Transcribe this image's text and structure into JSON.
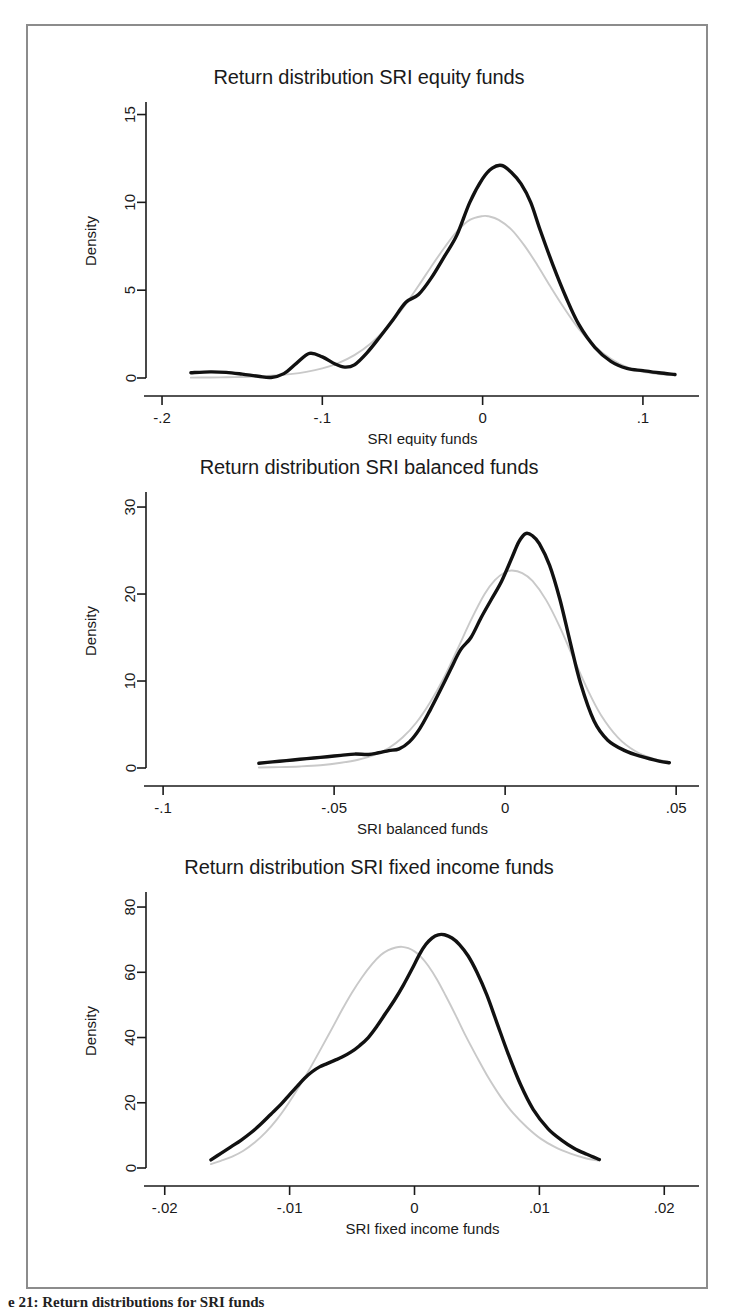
{
  "figure": {
    "caption": "e 21: Return distributions for SRI funds"
  },
  "panels": [
    {
      "id": "equity",
      "title": "Return distribution SRI equity funds",
      "xlabel": "SRI equity funds",
      "ylabel": "Density",
      "xticks": [
        "-.2",
        "-.1",
        "0",
        ".1"
      ],
      "yticks": [
        "0",
        "5",
        "10",
        "15"
      ]
    },
    {
      "id": "balanced",
      "title": "Return distribution SRI balanced funds",
      "xlabel": "SRI balanced funds",
      "ylabel": "Density",
      "xticks": [
        "-.1",
        "-.05",
        "0",
        ".05"
      ],
      "yticks": [
        "0",
        "10",
        "20",
        "30"
      ]
    },
    {
      "id": "fixed_income",
      "title": "Return distribution SRI fixed income funds",
      "xlabel": "SRI fixed income funds",
      "ylabel": "Density",
      "xticks": [
        "-.02",
        "-.01",
        "0",
        ".01",
        ".02"
      ],
      "yticks": [
        "0",
        "20",
        "40",
        "60",
        "80"
      ]
    }
  ],
  "chart_data": [
    {
      "type": "line",
      "title": "Return distribution SRI equity funds",
      "xlabel": "SRI equity funds",
      "ylabel": "Density",
      "xlim": [
        -0.21,
        0.125
      ],
      "ylim": [
        0,
        15.6
      ],
      "xticks": [
        -0.2,
        -0.1,
        0,
        0.1
      ],
      "yticks": [
        0,
        5,
        10,
        15
      ],
      "grid": false,
      "legend": "none",
      "series": [
        {
          "name": "Kernel density (SRI equity funds)",
          "color": "#111111",
          "x": [
            -0.182,
            -0.17,
            -0.16,
            -0.15,
            -0.14,
            -0.132,
            -0.124,
            -0.116,
            -0.108,
            -0.1,
            -0.092,
            -0.086,
            -0.08,
            -0.072,
            -0.064,
            -0.056,
            -0.048,
            -0.04,
            -0.032,
            -0.024,
            -0.016,
            -0.008,
            0.0,
            0.006,
            0.012,
            0.018,
            0.024,
            0.03,
            0.036,
            0.044,
            0.052,
            0.06,
            0.07,
            0.08,
            0.09,
            0.1,
            0.11,
            0.12
          ],
          "y": [
            0.3,
            0.35,
            0.32,
            0.22,
            0.1,
            0.03,
            0.25,
            0.85,
            1.4,
            1.2,
            0.8,
            0.62,
            0.75,
            1.45,
            2.35,
            3.3,
            4.3,
            4.75,
            5.7,
            6.9,
            8.15,
            10.0,
            11.35,
            11.95,
            12.1,
            11.7,
            11.05,
            10.0,
            8.4,
            6.4,
            4.6,
            3.05,
            1.75,
            0.95,
            0.55,
            0.42,
            0.3,
            0.2
          ]
        },
        {
          "name": "Normal reference density",
          "color": "#c9c9c9",
          "x": [
            -0.182,
            -0.17,
            -0.16,
            -0.15,
            -0.14,
            -0.13,
            -0.12,
            -0.11,
            -0.1,
            -0.09,
            -0.08,
            -0.07,
            -0.06,
            -0.05,
            -0.04,
            -0.032,
            -0.024,
            -0.016,
            -0.008,
            0.0,
            0.004,
            0.01,
            0.018,
            0.026,
            0.034,
            0.042,
            0.05,
            0.06,
            0.07,
            0.08,
            0.09,
            0.1,
            0.11,
            0.12
          ],
          "y": [
            0.02,
            0.03,
            0.04,
            0.06,
            0.09,
            0.14,
            0.22,
            0.35,
            0.55,
            0.85,
            1.3,
            1.95,
            2.85,
            3.95,
            5.25,
            6.35,
            7.4,
            8.35,
            9.0,
            9.22,
            9.2,
            9.0,
            8.45,
            7.55,
            6.45,
            5.25,
            4.1,
            2.8,
            1.8,
            1.1,
            0.62,
            0.35,
            0.22,
            0.15
          ]
        }
      ]
    },
    {
      "type": "line",
      "title": "Return distribution SRI balanced funds",
      "xlabel": "SRI balanced funds",
      "ylabel": "Density",
      "xlim": [
        -0.105,
        0.052
      ],
      "ylim": [
        0,
        31.5
      ],
      "xticks": [
        -0.1,
        -0.05,
        0,
        0.05
      ],
      "yticks": [
        0,
        10,
        20,
        30
      ],
      "grid": false,
      "legend": "none",
      "series": [
        {
          "name": "Kernel density (SRI balanced funds)",
          "color": "#111111",
          "x": [
            -0.072,
            -0.068,
            -0.064,
            -0.06,
            -0.056,
            -0.052,
            -0.048,
            -0.044,
            -0.04,
            -0.037,
            -0.034,
            -0.031,
            -0.028,
            -0.025,
            -0.022,
            -0.019,
            -0.016,
            -0.013,
            -0.01,
            -0.007,
            -0.004,
            -0.001,
            0.002,
            0.004,
            0.006,
            0.008,
            0.01,
            0.013,
            0.016,
            0.019,
            0.022,
            0.026,
            0.03,
            0.035,
            0.04,
            0.045,
            0.048
          ],
          "y": [
            0.55,
            0.7,
            0.85,
            1.0,
            1.15,
            1.3,
            1.45,
            1.6,
            1.55,
            1.75,
            2.0,
            2.2,
            3.0,
            4.5,
            6.6,
            8.9,
            11.3,
            13.6,
            15.0,
            17.3,
            19.4,
            21.5,
            24.2,
            26.0,
            26.95,
            26.7,
            25.8,
            23.3,
            19.4,
            14.5,
            9.8,
            5.4,
            3.2,
            2.0,
            1.3,
            0.8,
            0.6
          ]
        },
        {
          "name": "Normal reference density",
          "color": "#c9c9c9",
          "x": [
            -0.072,
            -0.066,
            -0.06,
            -0.054,
            -0.048,
            -0.043,
            -0.038,
            -0.034,
            -0.03,
            -0.026,
            -0.022,
            -0.018,
            -0.014,
            -0.01,
            -0.006,
            -0.003,
            0.0,
            0.002,
            0.005,
            0.008,
            0.012,
            0.016,
            0.02,
            0.024,
            0.028,
            0.033,
            0.038,
            0.043,
            0.048
          ],
          "y": [
            0.05,
            0.1,
            0.18,
            0.32,
            0.6,
            0.95,
            1.55,
            2.3,
            3.5,
            5.2,
            7.5,
            10.3,
            13.6,
            17.0,
            20.0,
            21.6,
            22.5,
            22.7,
            22.4,
            21.5,
            19.3,
            16.2,
            12.6,
            9.1,
            6.1,
            3.5,
            1.95,
            1.1,
            0.7
          ]
        }
      ]
    },
    {
      "type": "line",
      "title": "Return distribution SRI fixed income funds",
      "xlabel": "SRI fixed income funds",
      "ylabel": "Density",
      "xlim": [
        -0.0215,
        0.0215
      ],
      "ylim": [
        0,
        84
      ],
      "xticks": [
        -0.02,
        -0.01,
        0,
        0.01,
        0.02
      ],
      "yticks": [
        0,
        20,
        40,
        60,
        80
      ],
      "grid": false,
      "legend": "none",
      "series": [
        {
          "name": "Kernel density (SRI fixed income funds)",
          "color": "#111111",
          "x": [
            -0.0163,
            -0.0155,
            -0.0147,
            -0.0139,
            -0.0131,
            -0.0123,
            -0.0115,
            -0.0107,
            -0.01,
            -0.0094,
            -0.0088,
            -0.0082,
            -0.0076,
            -0.007,
            -0.0064,
            -0.0058,
            -0.0051,
            -0.0044,
            -0.0037,
            -0.003,
            -0.0023,
            -0.0016,
            -0.0009,
            -0.0002,
            0.0004,
            0.0009,
            0.0014,
            0.0019,
            0.0024,
            0.003,
            0.0036,
            0.0043,
            0.005,
            0.0058,
            0.0066,
            0.0075,
            0.0085,
            0.0095,
            0.0107,
            0.0118,
            0.0128,
            0.0138,
            0.0148
          ],
          "y": [
            2.5,
            4.5,
            6.5,
            8.5,
            10.8,
            13.5,
            16.5,
            19.5,
            22.5,
            25.0,
            27.5,
            29.5,
            31.0,
            32.0,
            33.0,
            34.0,
            35.5,
            37.5,
            40.0,
            43.5,
            47.5,
            51.5,
            56.0,
            61.0,
            65.5,
            68.5,
            70.5,
            71.5,
            71.5,
            70.5,
            68.5,
            65.0,
            60.0,
            53.0,
            44.5,
            35.0,
            25.5,
            18.0,
            12.0,
            8.5,
            6.0,
            4.2,
            2.6
          ]
        },
        {
          "name": "Normal reference density",
          "color": "#c9c9c9",
          "x": [
            -0.0163,
            -0.0155,
            -0.0146,
            -0.0137,
            -0.0128,
            -0.0119,
            -0.011,
            -0.0101,
            -0.0092,
            -0.0083,
            -0.0074,
            -0.0066,
            -0.0058,
            -0.005,
            -0.0042,
            -0.0034,
            -0.0027,
            -0.0021,
            -0.0015,
            -0.001,
            -0.0005,
            0.0,
            0.0005,
            0.0011,
            0.0018,
            0.0025,
            0.0033,
            0.0041,
            0.005,
            0.0059,
            0.0069,
            0.0079,
            0.009,
            0.0101,
            0.0113,
            0.0125,
            0.0137,
            0.0148
          ],
          "y": [
            1.2,
            2.2,
            3.5,
            5.3,
            7.8,
            11.0,
            15.0,
            19.8,
            25.2,
            31.0,
            37.2,
            42.8,
            48.5,
            53.8,
            58.5,
            62.5,
            65.3,
            66.8,
            67.6,
            67.8,
            67.4,
            66.4,
            64.8,
            62.0,
            57.8,
            52.8,
            46.8,
            40.5,
            34.0,
            27.8,
            21.8,
            16.8,
            12.5,
            9.0,
            6.3,
            4.4,
            3.0,
            2.2
          ]
        }
      ]
    }
  ]
}
